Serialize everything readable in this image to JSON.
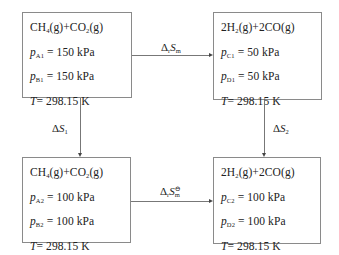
{
  "diagram": {
    "type": "thermodynamic-cycle",
    "boxes": {
      "top_left": {
        "reaction": {
          "lhs1": "CH",
          "lhs1_sub": "4",
          "lhs1_phase": "(g)",
          "plus": "+",
          "lhs2": "CO",
          "lhs2_sub": "2",
          "lhs2_phase": "(g)"
        },
        "p1": {
          "var": "p",
          "sub": "A1",
          "value": "= 150 kPa"
        },
        "p2": {
          "var": "p",
          "sub": "B1",
          "value": "= 150 kPa"
        },
        "temp": {
          "var": "T",
          "value": "= 298.15  K"
        }
      },
      "top_right": {
        "reaction": {
          "lhs1": "2H",
          "lhs1_sub": "2",
          "lhs1_phase": "(g)",
          "plus": "+",
          "lhs2": "2CO",
          "lhs2_sub": "",
          "lhs2_phase": "(g)"
        },
        "p1": {
          "var": "p",
          "sub": "C1",
          "value": "= 50  kPa"
        },
        "p2": {
          "var": "p",
          "sub": "D1",
          "value": "= 50  kPa"
        },
        "temp": {
          "var": "T",
          "value": "= 298.15  K"
        }
      },
      "bottom_left": {
        "reaction": {
          "lhs1": "CH",
          "lhs1_sub": "4",
          "lhs1_phase": "(g)",
          "plus": "+",
          "lhs2": "CO",
          "lhs2_sub": "2",
          "lhs2_phase": "(g)"
        },
        "p1": {
          "var": "p",
          "sub": "A2",
          "value": "= 100  kPa"
        },
        "p2": {
          "var": "p",
          "sub": "B2",
          "value": "= 100  kPa"
        },
        "temp": {
          "var": "T",
          "value": "= 298.15  K"
        }
      },
      "bottom_right": {
        "reaction": {
          "lhs1": "2H",
          "lhs1_sub": "2",
          "lhs1_phase": "(g)",
          "plus": "+",
          "lhs2": "2CO",
          "lhs2_sub": "",
          "lhs2_phase": "(g)"
        },
        "p1": {
          "var": "p",
          "sub": "C2",
          "value": "= 100  kPa"
        },
        "p2": {
          "var": "p",
          "sub": "D2",
          "value": "= 100  kPa"
        },
        "temp": {
          "var": "T",
          "value": "= 298.15  K"
        }
      }
    },
    "arrows": {
      "top": {
        "delta": "Δ",
        "delta_sub": "r",
        "var": "S",
        "var_sub": "m",
        "sup": ""
      },
      "bottom": {
        "delta": "Δ",
        "delta_sub": "r",
        "var": "S",
        "var_sub": "m",
        "sup": "⊖"
      },
      "left": {
        "delta": "Δ",
        "var": "S",
        "var_sub": "1"
      },
      "right": {
        "delta": "Δ",
        "var": "S",
        "var_sub": "2"
      }
    },
    "colors": {
      "border": "#8a8a8a",
      "line": "#777777",
      "text": "#222222"
    }
  }
}
